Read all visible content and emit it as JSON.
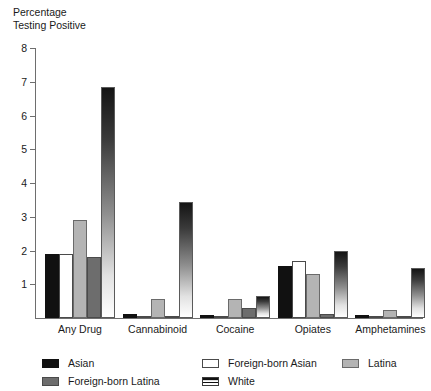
{
  "chart_data": {
    "type": "bar",
    "title": "",
    "ylabel": "Percentage\nTesting Positive",
    "xlabel": "",
    "ylim": [
      0,
      8
    ],
    "yticks": [
      0,
      1,
      2,
      3,
      4,
      5,
      6,
      7,
      8
    ],
    "ytick_labels": [
      "",
      "1",
      "2",
      "3",
      "4",
      "5",
      "6",
      "7",
      "8"
    ],
    "grid": false,
    "legend_position": "bottom",
    "categories": [
      "Any Drug",
      "Cannabinoid",
      "Cocaine",
      "Opiates",
      "Amphetamines"
    ],
    "series": [
      {
        "name": "Asian",
        "key": "asian",
        "color": "#111111",
        "values": [
          1.9,
          0.13,
          0.1,
          1.55,
          0.1
        ]
      },
      {
        "name": "Foreign-born Asian",
        "key": "fb-asian",
        "color": "#ffffff",
        "values": [
          1.9,
          0.04,
          0.02,
          1.7,
          0.02
        ]
      },
      {
        "name": "Latina",
        "key": "latina",
        "color": "#b4b4b4",
        "values": [
          2.9,
          0.55,
          0.55,
          1.3,
          0.25
        ]
      },
      {
        "name": "Foreign-born Latina",
        "key": "fb-latina",
        "color": "#6d6d6d",
        "values": [
          1.8,
          0.02,
          0.3,
          0.12,
          0.05
        ]
      },
      {
        "name": "White",
        "key": "white",
        "color": "gradient-dark-to-white",
        "values": [
          6.85,
          3.45,
          0.65,
          1.98,
          1.48
        ]
      }
    ]
  },
  "axis": {
    "y_title_line1": "Percentage",
    "y_title_line2": "Testing Positive",
    "ticks": [
      {
        "value": 8,
        "label": "8"
      },
      {
        "value": 7,
        "label": "7"
      },
      {
        "value": 6,
        "label": "6"
      },
      {
        "value": 5,
        "label": "5"
      },
      {
        "value": 4,
        "label": "4"
      },
      {
        "value": 3,
        "label": "3"
      },
      {
        "value": 2,
        "label": "2"
      },
      {
        "value": 1,
        "label": "1"
      }
    ]
  },
  "legend": {
    "column1": [
      {
        "key": "asian",
        "label": "Asian"
      },
      {
        "key": "fb-latina",
        "label": "Foreign-born Latina"
      }
    ],
    "column2": [
      {
        "key": "fb-asian",
        "label": "Foreign-born Asian"
      },
      {
        "key": "white",
        "label": "White"
      }
    ],
    "column3": [
      {
        "key": "latina",
        "label": "Latina"
      }
    ]
  }
}
